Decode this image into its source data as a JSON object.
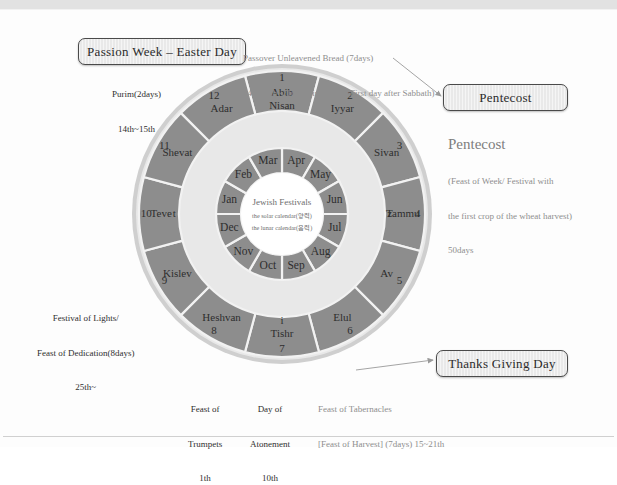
{
  "diagram": {
    "hub": {
      "line1": "Jewish Festivals",
      "line2": "the solar calendar(양력)",
      "line3": "the lunar calendar(음력)"
    },
    "outer_ring": [
      {
        "number": "1",
        "name": "Abib\nNisan"
      },
      {
        "number": "2",
        "name": "Iyyar"
      },
      {
        "number": "3",
        "name": "Sivan"
      },
      {
        "number": "4",
        "name": "Tammu\nz"
      },
      {
        "number": "5",
        "name": "Av"
      },
      {
        "number": "6",
        "name": "Elul"
      },
      {
        "number": "7",
        "name": "Tishr\ni"
      },
      {
        "number": "8",
        "name": "Heshvan"
      },
      {
        "number": "9",
        "name": "Kislev"
      },
      {
        "number": "10",
        "name": "Teve\nt"
      },
      {
        "number": "11",
        "name": "Shevat"
      },
      {
        "number": "12",
        "name": "Adar"
      }
    ],
    "inner_ring": [
      "Apr",
      "May",
      "Jun",
      "Jul",
      "Aug",
      "Sep",
      "Oct",
      "Nov",
      "Dec",
      "Jan",
      "Feb",
      "Mar"
    ]
  },
  "callouts": {
    "passion_week": "Passion Week – Easter Day",
    "pentecost": "Pentecost",
    "thanks_giving": "Thanks Giving Day"
  },
  "annotations": {
    "passover": {
      "line1": "Passover Unleavened Bread (7days)",
      "line2": "14th 15th~21th    First Fruits(First day after Sabbath)"
    },
    "purim": {
      "line1": "Purim(2days)",
      "line2": "14th~15th"
    },
    "pentecost": {
      "heading": "Pentecost",
      "line1": "(Feast of Week/ Festival with",
      "line2": "the first crop of the wheat harvest)",
      "line3": "50days"
    },
    "lights": {
      "line1": "Festival of Lights/",
      "line2": "Feast of Dedication(8days)",
      "line3": "25th~"
    },
    "trumpets": {
      "line1": "Feast of",
      "line2": "Trumpets",
      "line3": "1th"
    },
    "atonement": {
      "line1": "Day of",
      "line2": "Atonement",
      "line3": "10th"
    },
    "tabernacles": {
      "line1": "Feast of Tabernacles",
      "line2": "[Feast of Harvest] (7days) 15~21th"
    }
  },
  "colors": {
    "ring_fill": "#8d8d8d",
    "ring_stroke": "#f2f2f2",
    "hub_fill": "#ffffff",
    "callout_fill": "#e9e9e9",
    "callout_border": "#4a4a4a",
    "annotation_gray": "#8e8e8e",
    "annotation_dark": "#2f2f2f"
  }
}
